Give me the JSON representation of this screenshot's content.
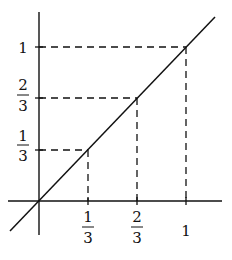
{
  "diagram": {
    "title": "",
    "origin": {
      "x": 39,
      "y": 201
    },
    "unit": 147,
    "line_color": "#111111",
    "x_ticks": [
      {
        "value": "1/3",
        "num": "1",
        "den": "3",
        "px": 88
      },
      {
        "value": "2/3",
        "num": "2",
        "den": "3",
        "px": 137
      },
      {
        "value": "1",
        "label": "1",
        "px": 186
      }
    ],
    "y_ticks": [
      {
        "value": "1/3",
        "num": "1",
        "den": "3",
        "py": 150
      },
      {
        "value": "2/3",
        "num": "2",
        "den": "3",
        "py": 98
      },
      {
        "value": "1",
        "label": "1",
        "py": 47
      }
    ]
  }
}
